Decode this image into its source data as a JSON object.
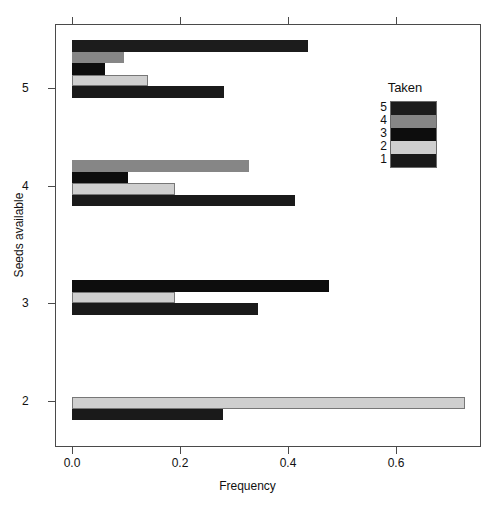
{
  "chart_data": {
    "type": "bar",
    "orientation": "horizontal",
    "title": "",
    "xlabel": "Frequency",
    "ylabel": "Seeds available",
    "xlim": [
      0.0,
      0.79
    ],
    "xticks": [
      0.0,
      0.2,
      0.4,
      0.6
    ],
    "xticklabels": [
      "0.0",
      "0.2",
      "0.4",
      "0.6"
    ],
    "yticks": [
      2,
      3,
      4,
      5
    ],
    "yticklabels": [
      "2",
      "3",
      "4",
      "5"
    ],
    "grid": false,
    "legend": {
      "title": "Taken",
      "position": "upper right",
      "entries": [
        {
          "label": "5",
          "color": "#1c1c1c"
        },
        {
          "label": "4",
          "color": "#868686"
        },
        {
          "label": "3",
          "color": "#0d0d0d"
        },
        {
          "label": "2",
          "color": "#cfcfcf"
        },
        {
          "label": "1",
          "color": "#1a1a1a"
        }
      ]
    },
    "groups": [
      {
        "category": "5",
        "bars": [
          {
            "taken": "5",
            "value": 0.437,
            "color": "#1c1c1c"
          },
          {
            "taken": "4",
            "value": 0.096,
            "color": "#868686"
          },
          {
            "taken": "3",
            "value": 0.061,
            "color": "#0d0d0d"
          },
          {
            "taken": "2",
            "value": 0.141,
            "color": "#cfcfcf"
          },
          {
            "taken": "1",
            "value": 0.281,
            "color": "#1a1a1a"
          }
        ]
      },
      {
        "category": "4",
        "bars": [
          {
            "taken": "4",
            "value": 0.328,
            "color": "#868686"
          },
          {
            "taken": "3",
            "value": 0.104,
            "color": "#0d0d0d"
          },
          {
            "taken": "2",
            "value": 0.191,
            "color": "#cfcfcf"
          },
          {
            "taken": "1",
            "value": 0.413,
            "color": "#1a1a1a"
          }
        ]
      },
      {
        "category": "3",
        "bars": [
          {
            "taken": "3",
            "value": 0.476,
            "color": "#0d0d0d"
          },
          {
            "taken": "2",
            "value": 0.191,
            "color": "#cfcfcf"
          },
          {
            "taken": "1",
            "value": 0.344,
            "color": "#1a1a1a"
          }
        ]
      },
      {
        "category": "2",
        "bars": [
          {
            "taken": "2",
            "value": 0.728,
            "color": "#cfcfcf"
          },
          {
            "taken": "1",
            "value": 0.28,
            "color": "#1a1a1a"
          }
        ]
      }
    ]
  },
  "caption": ""
}
